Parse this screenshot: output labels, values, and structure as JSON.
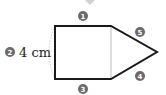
{
  "diagram": {
    "shape": "pentagon composed of a square and a triangle",
    "side_label": "4 cm",
    "markers": [
      {
        "id": "1",
        "glyph": "1",
        "position": "top edge"
      },
      {
        "id": "2",
        "glyph": "2",
        "position": "left edge"
      },
      {
        "id": "3",
        "glyph": "3",
        "position": "bottom edge"
      },
      {
        "id": "4",
        "glyph": "4",
        "position": "lower slanted edge"
      },
      {
        "id": "5",
        "glyph": "5",
        "position": "upper slanted edge"
      }
    ],
    "colors": {
      "outline": "#1a1a1a",
      "marker_fill": "#6b6b6b",
      "divider": "#bbbbbb",
      "top_arrow": "#c8c8c8"
    }
  }
}
